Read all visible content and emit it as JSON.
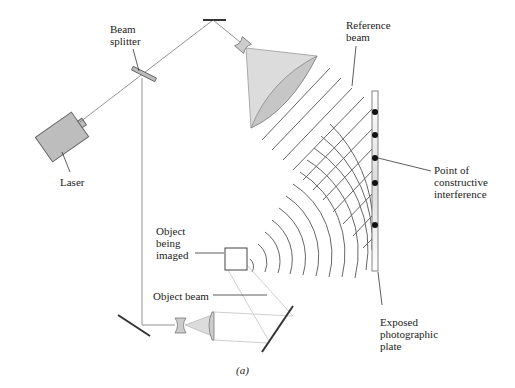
{
  "figure": {
    "caption": "(a)",
    "labels": {
      "beam_splitter": "Beam\nsplitter",
      "laser": "Laser",
      "reference_beam": "Reference\nbeam",
      "point_constructive": "Point of\nconstructive\ninterference",
      "object_imaged": "Object\nbeing\nimaged",
      "object_beam": "Object beam",
      "exposed_plate": "Exposed\nphotographic\nplate"
    },
    "colors": {
      "line": "#555555",
      "laser_fill": "#bdbdbd",
      "cone_fill": "#d9d9d9",
      "cone_inner": "#c8c8c8",
      "beam_light": "#cfcfcf"
    },
    "interference_points_y": [
      112,
      135,
      158,
      183,
      225
    ]
  }
}
